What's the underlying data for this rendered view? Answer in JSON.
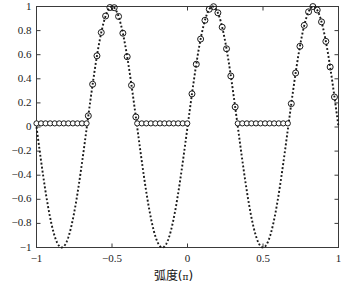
{
  "chart_data": {
    "type": "line",
    "title": "",
    "xlabel": "弧度(π)",
    "ylabel": "",
    "xlim": [
      -1,
      1
    ],
    "ylim": [
      -1,
      1
    ],
    "grid": false,
    "legend": null,
    "xticks": [
      -1,
      -0.5,
      0,
      0.5,
      1
    ],
    "xtick_labels": [
      "-1",
      "-0.5",
      "0",
      "0.5",
      "1"
    ],
    "yticks": [
      -1,
      -0.8,
      -0.6,
      -0.4,
      -0.2,
      0,
      0.2,
      0.4,
      0.6,
      0.8,
      1
    ],
    "ytick_labels": [
      "-1",
      "-0.8",
      "-0.6",
      "-0.4",
      "-0.2",
      "0",
      "0.2",
      "0.4",
      "0.6",
      "0.8",
      "1"
    ],
    "line_color": "#1a1a1a",
    "marker": "circle",
    "linestyle": "dotted",
    "series": [
      {
        "name": "cosine-wave",
        "marker_step": 8,
        "x": [
          -1,
          -0.98,
          -0.96,
          -0.94,
          -0.92,
          -0.9,
          -0.88,
          -0.86,
          -0.84,
          -0.82,
          -0.8,
          -0.78,
          -0.76,
          -0.74,
          -0.72,
          -0.7,
          -0.68,
          -0.66,
          -0.64,
          -0.62,
          -0.6,
          -0.58,
          -0.56,
          -0.54,
          -0.52,
          -0.5,
          -0.48,
          -0.46,
          -0.44,
          -0.42,
          -0.4,
          -0.38,
          -0.36,
          -0.34,
          -0.32,
          -0.3,
          -0.28,
          -0.26,
          -0.24,
          -0.22,
          -0.2,
          -0.18,
          -0.16,
          -0.14,
          -0.12,
          -0.1,
          -0.08,
          -0.06,
          -0.04,
          -0.02,
          0,
          0.02,
          0.04,
          0.06,
          0.08,
          0.1,
          0.12,
          0.14,
          0.16,
          0.18,
          0.2,
          0.22,
          0.24,
          0.26,
          0.28,
          0.3,
          0.32,
          0.34,
          0.36,
          0.38,
          0.4,
          0.42,
          0.44,
          0.46,
          0.48,
          0.5,
          0.52,
          0.54,
          0.56,
          0.58,
          0.6,
          0.62,
          0.64,
          0.66,
          0.68,
          0.7,
          0.72,
          0.74,
          0.76,
          0.78,
          0.8,
          0.82,
          0.84,
          0.86,
          0.88,
          0.9,
          0.92,
          0.94,
          0.96,
          0.98,
          1
        ],
        "y_formula": "cos(3*pi*(x + 0.5))",
        "peaks_x": [
          -0.5,
          0.1667,
          0.8333
        ],
        "troughs_x": [
          -0.8333,
          -0.1667,
          0.5
        ],
        "peak_value": 1,
        "trough_value": -1,
        "period": 0.6667
      },
      {
        "name": "clipped-zero-level",
        "level": 0.03,
        "marker": "circle",
        "dense_markers": true,
        "segments": [
          [
            -1,
            -0.667
          ],
          [
            -0.333,
            0.0
          ],
          [
            0.333,
            0.667
          ]
        ]
      }
    ]
  },
  "axes": {
    "frame_color": "#3a3a3a",
    "background": "#ffffff"
  }
}
